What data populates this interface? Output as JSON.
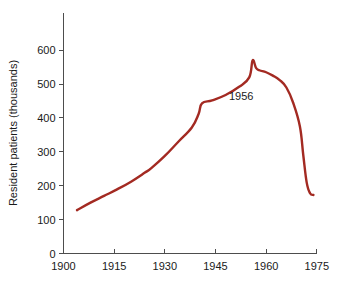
{
  "chart_data": {
    "type": "line",
    "title": "",
    "xlabel": "",
    "ylabel": "Resident patients (thousands)",
    "xlim": [
      1900,
      1975
    ],
    "ylim": [
      0,
      650
    ],
    "grid": false,
    "legend": null,
    "xticks": [
      1900,
      1915,
      1930,
      1945,
      1960,
      1975
    ],
    "xtick_labels": [
      "1900",
      "1915",
      "1930",
      "1945",
      "1960",
      "1975"
    ],
    "yticks": [
      0,
      100,
      200,
      300,
      400,
      500,
      600
    ],
    "ytick_labels": [
      "0",
      "100",
      "200",
      "300",
      "400",
      "500",
      "600"
    ],
    "series": [
      {
        "name": "Resident patients",
        "color": "#a32a22",
        "x": [
          1904,
          1908,
          1912,
          1916,
          1920,
          1924,
          1926,
          1930,
          1934,
          1938,
          1940,
          1941,
          1944,
          1948,
          1952,
          1955,
          1956,
          1957,
          1958,
          1960,
          1962,
          1964,
          1966,
          1968,
          1970,
          1971,
          1972,
          1973,
          1974
        ],
        "y": [
          128,
          150,
          170,
          190,
          212,
          238,
          252,
          288,
          330,
          372,
          412,
          443,
          452,
          468,
          492,
          520,
          570,
          548,
          541,
          535,
          525,
          512,
          490,
          445,
          375,
          290,
          210,
          178,
          173
        ]
      }
    ],
    "annotations": [
      {
        "text": "1956",
        "x": 1955,
        "y": 480,
        "points_to_year": 1956,
        "points_to_value": 570
      }
    ]
  },
  "axis": {
    "ylabel": "Resident patients (thousands)"
  }
}
